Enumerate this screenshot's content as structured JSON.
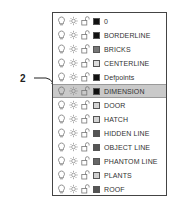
{
  "callout": {
    "label": "2"
  },
  "layers": [
    {
      "name": "0",
      "color": "#111111",
      "selected": false
    },
    {
      "name": "BORDERLINE",
      "color": "#111111",
      "selected": false
    },
    {
      "name": "BRICKS",
      "color": "#777777",
      "selected": false
    },
    {
      "name": "CENTERLINE",
      "color": "#dddddd",
      "selected": false
    },
    {
      "name": "Defpoints",
      "color": "#111111",
      "selected": false
    },
    {
      "name": "DIMENSION",
      "color": "#111111",
      "selected": true
    },
    {
      "name": "DOOR",
      "color": "#d4d4d4",
      "selected": false
    },
    {
      "name": "HATCH",
      "color": "#d4d4d4",
      "selected": false
    },
    {
      "name": "HIDDEN LINE",
      "color": "#555555",
      "selected": false
    },
    {
      "name": "OBJECT LINE",
      "color": "#555555",
      "selected": false
    },
    {
      "name": "PHANTOM LINE",
      "color": "#666666",
      "selected": false
    },
    {
      "name": "PLANTS",
      "color": "#d0d0d0",
      "selected": false
    },
    {
      "name": "ROOF",
      "color": "#555555",
      "selected": false
    }
  ],
  "icons": {
    "on": "lightbulb-icon",
    "freeze": "sun-icon",
    "lock": "unlock-icon"
  }
}
